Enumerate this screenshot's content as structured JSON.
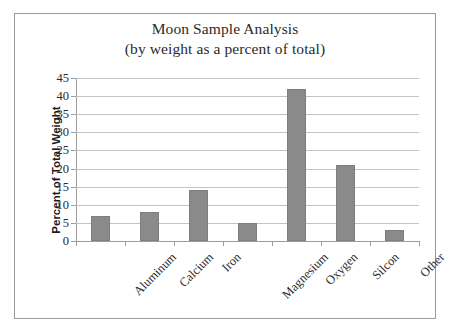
{
  "chart_data": {
    "type": "bar",
    "title": "Moon Sample Analysis",
    "subtitle": "(by weight as a percent of total)",
    "xlabel": "",
    "ylabel": "Percent of Total Weight",
    "categories": [
      "Aluminum",
      "Calcium",
      "Iron",
      "Magnesium",
      "Oxygen",
      "Silcon",
      "Other"
    ],
    "values": [
      7,
      8,
      14,
      5,
      42,
      21,
      3
    ],
    "ylim": [
      0,
      45
    ],
    "ytick_step": 5,
    "yticks": [
      45,
      40,
      35,
      30,
      25,
      20,
      15,
      10,
      5,
      0
    ],
    "grid": true,
    "legend": false,
    "bar_color": "#8a8a8a",
    "grid_color": "#c3c3c3",
    "axis_color": "#9d9d9d",
    "text_color": "#2b2b2b"
  }
}
